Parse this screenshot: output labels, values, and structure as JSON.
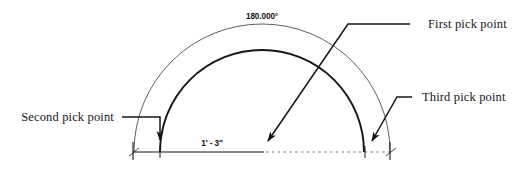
{
  "diagram": {
    "type": "cad-arc-dimension",
    "background_color": "#ffffff",
    "line_color": "#1a1a1a",
    "thin_line_color": "#5a5a5a",
    "annotations": {
      "angular_dimension": "180.000°",
      "linear_dimension": "1' - 3\"",
      "label_first": "First pick point",
      "label_second": "Second pick point",
      "label_third": "Third pick point"
    },
    "geometry": {
      "center_x": 262,
      "baseline_y": 152,
      "outer_arc_radius": 128,
      "inner_arc_radius": 102,
      "baseline_left_x": 133,
      "baseline_right_x": 390,
      "inner_arc_left_x": 160,
      "inner_arc_right_x": 365
    }
  }
}
